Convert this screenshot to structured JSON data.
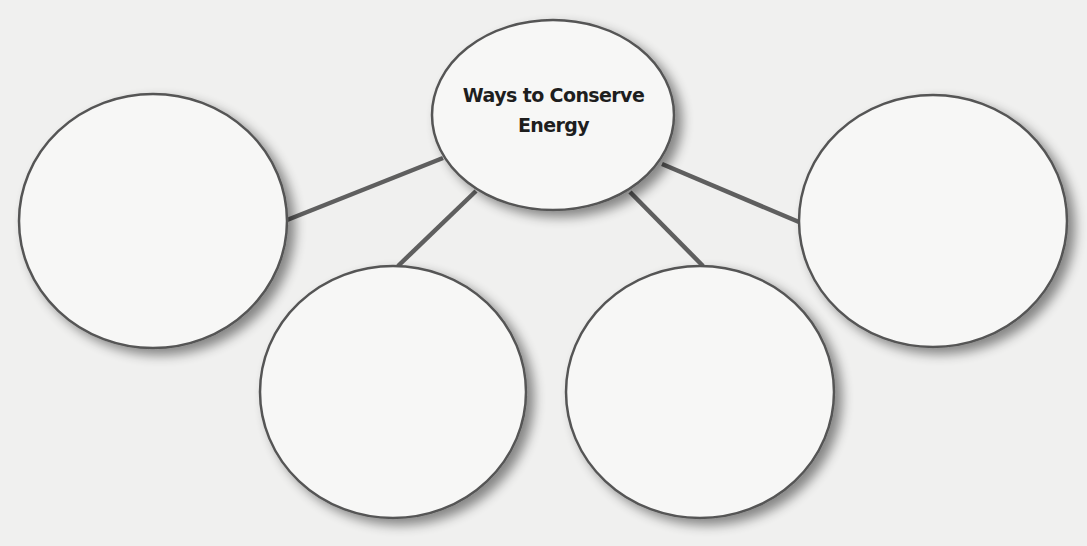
{
  "diagram": {
    "type": "concept-web",
    "colors": {
      "background": "#f0f0ef",
      "node_fill": "#f7f7f6",
      "node_stroke": "#555555",
      "connector": "#5f5f5f",
      "text": "#1e1e1e"
    },
    "center_node": {
      "label_line1": "Ways to Conserve",
      "label_line2": "Energy",
      "shape": "ellipse",
      "cx": 553,
      "cy": 115,
      "rx": 121,
      "ry": 95
    },
    "outer_nodes": [
      {
        "id": "left",
        "label": "",
        "cx": 153,
        "cy": 221,
        "rx": 134,
        "ry": 127
      },
      {
        "id": "bottom-left",
        "label": "",
        "cx": 393,
        "cy": 392,
        "rx": 133,
        "ry": 126
      },
      {
        "id": "bottom-right",
        "label": "",
        "cx": 700,
        "cy": 392,
        "rx": 134,
        "ry": 126
      },
      {
        "id": "right",
        "label": "",
        "cx": 933,
        "cy": 221,
        "rx": 134,
        "ry": 126
      }
    ],
    "connectors": [
      {
        "from": "center",
        "to": "left",
        "x1": 443,
        "y1": 158,
        "x2": 287,
        "y2": 220
      },
      {
        "from": "center",
        "to": "bottom-left",
        "x1": 476,
        "y1": 191,
        "x2": 398,
        "y2": 266
      },
      {
        "from": "center",
        "to": "bottom-right",
        "x1": 630,
        "y1": 192,
        "x2": 703,
        "y2": 266
      },
      {
        "from": "center",
        "to": "right",
        "x1": 662,
        "y1": 164,
        "x2": 799,
        "y2": 222
      }
    ]
  }
}
